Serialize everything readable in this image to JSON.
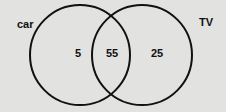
{
  "diagram": {
    "type": "venn",
    "sets": [
      {
        "label": "car",
        "only_value": "5"
      },
      {
        "label": "TV",
        "only_value": "25"
      }
    ],
    "intersection_value": "55"
  },
  "colors": {
    "background": "#e2e2e0",
    "stroke": "#111111"
  }
}
